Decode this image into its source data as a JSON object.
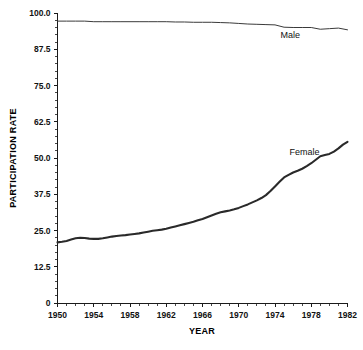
{
  "chart_data": {
    "type": "line",
    "title": "",
    "xlabel": "YEAR",
    "ylabel": "PARTICIPATION RATE",
    "xlim": [
      1950,
      1982
    ],
    "ylim": [
      0,
      100
    ],
    "grid": false,
    "legend": "inline-annotations",
    "x_ticks": [
      "1950",
      "1954",
      "1958",
      "1962",
      "1966",
      "1970",
      "1974",
      "1978",
      "1982"
    ],
    "x_tick_values": [
      1950,
      1954,
      1958,
      1962,
      1966,
      1970,
      1974,
      1978,
      1982
    ],
    "y_ticks": [
      "0",
      "12.5",
      "25.0",
      "37.5",
      "50.0",
      "62.5",
      "75.0",
      "87.5",
      "100.0"
    ],
    "y_tick_values": [
      0,
      12.5,
      25,
      37.5,
      50,
      62.5,
      75,
      87.5,
      100
    ],
    "x": [
      1950,
      1951,
      1952,
      1953,
      1954,
      1955,
      1956,
      1957,
      1958,
      1959,
      1960,
      1961,
      1962,
      1963,
      1964,
      1965,
      1966,
      1967,
      1968,
      1969,
      1970,
      1971,
      1972,
      1973,
      1974,
      1975,
      1976,
      1977,
      1978,
      1979,
      1980,
      1981,
      1982
    ],
    "series": [
      {
        "name": "Male",
        "label": "Male",
        "color": "#3a3a3a",
        "annotation_x": 1974.6,
        "annotation_y": 91.5,
        "values": [
          97.2,
          97.2,
          97.3,
          97.3,
          97.0,
          97.0,
          97.0,
          97.0,
          97.0,
          97.0,
          97.0,
          97.0,
          97.0,
          96.9,
          96.9,
          96.8,
          96.8,
          96.8,
          96.7,
          96.6,
          96.4,
          96.1,
          96.0,
          95.9,
          95.9,
          95.0,
          94.9,
          94.9,
          95.0,
          94.4,
          94.6,
          94.8,
          94.2
        ]
      },
      {
        "name": "Female",
        "label": "Female",
        "color": "#2a2a2a",
        "annotation_x": 1975.6,
        "annotation_y": 51.0,
        "values": [
          21.0,
          21.5,
          22.0,
          22.3,
          22.0,
          22.1,
          22.8,
          23.1,
          23.4,
          23.8,
          24.3,
          24.9,
          25.4,
          26.0,
          26.7,
          27.3,
          28.2,
          29.1,
          30.1,
          31.1,
          31.8,
          32.4,
          33.3,
          34.5,
          36.0,
          37.9,
          39.9,
          42.4,
          44.8,
          46.4,
          47.8,
          49.6,
          51.0
        ]
      }
    ],
    "female_detail_x": [
      1950,
      1950.5,
      1951,
      1951.5,
      1952,
      1952.5,
      1953,
      1953.5,
      1954,
      1954.5,
      1955,
      1955.5,
      1956,
      1956.5,
      1957,
      1957.5,
      1958,
      1958.5,
      1959,
      1959.5,
      1960,
      1960.5,
      1961,
      1961.5,
      1962,
      1962.5,
      1963,
      1963.5,
      1964,
      1964.5,
      1965,
      1965.5,
      1966,
      1966.5,
      1967,
      1967.5,
      1968,
      1968.5,
      1969,
      1969.5,
      1970,
      1970.5,
      1971,
      1971.5,
      1972,
      1972.5,
      1973,
      1973.5,
      1974,
      1974.5,
      1975,
      1975.5,
      1976,
      1976.5,
      1977,
      1977.5,
      1978,
      1978.5,
      1979,
      1979.5,
      1980,
      1980.5,
      1981,
      1981.5,
      1982
    ],
    "female_detail_y": [
      20.9,
      21.1,
      21.4,
      21.9,
      22.3,
      22.5,
      22.4,
      22.2,
      22.1,
      22.1,
      22.3,
      22.6,
      22.9,
      23.1,
      23.3,
      23.4,
      23.6,
      23.8,
      24.0,
      24.3,
      24.6,
      24.9,
      25.1,
      25.3,
      25.6,
      26.0,
      26.4,
      26.8,
      27.2,
      27.6,
      28.0,
      28.5,
      29.0,
      29.6,
      30.2,
      30.8,
      31.3,
      31.6,
      31.9,
      32.3,
      32.8,
      33.4,
      34.0,
      34.7,
      35.4,
      36.2,
      37.2,
      38.6,
      40.2,
      41.8,
      43.3,
      44.2,
      45.0,
      45.6,
      46.3,
      47.2,
      48.2,
      49.4,
      50.6,
      51.0,
      51.4,
      52.2,
      53.3,
      54.6,
      55.6
    ],
    "male_detail_x": [
      1950,
      1951,
      1952,
      1953,
      1954,
      1955,
      1956,
      1957,
      1958,
      1959,
      1960,
      1961,
      1962,
      1963,
      1964,
      1965,
      1966,
      1967,
      1968,
      1969,
      1970,
      1971,
      1972,
      1973,
      1974,
      1975,
      1976,
      1977,
      1978,
      1979,
      1980,
      1981,
      1982
    ],
    "male_detail_y": [
      97.2,
      97.2,
      97.2,
      97.2,
      97.0,
      97.0,
      97.0,
      97.0,
      97.0,
      97.0,
      97.0,
      97.0,
      97.0,
      96.9,
      96.9,
      96.8,
      96.8,
      96.8,
      96.7,
      96.6,
      96.4,
      96.2,
      96.1,
      96.0,
      95.9,
      95.1,
      95.0,
      95.0,
      95.0,
      94.4,
      94.6,
      94.8,
      94.2
    ]
  },
  "figure": {
    "background": "#ffffff",
    "axis_color": "#1a1a1a"
  }
}
